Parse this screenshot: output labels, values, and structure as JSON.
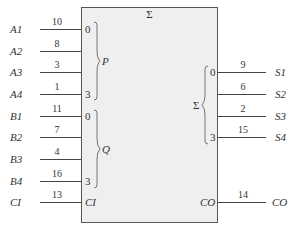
{
  "block": {
    "title": "Σ",
    "fill": "#efefef",
    "border": "#555555"
  },
  "inputs": [
    {
      "signal": "A1",
      "pin": "10",
      "port": "0",
      "y": 29
    },
    {
      "signal": "A2",
      "pin": "8",
      "port": "",
      "y": 51
    },
    {
      "signal": "A3",
      "pin": "3",
      "port": "",
      "y": 72
    },
    {
      "signal": "A4",
      "pin": "1",
      "port": "3",
      "y": 94
    },
    {
      "signal": "B1",
      "pin": "11",
      "port": "0",
      "y": 116
    },
    {
      "signal": "B2",
      "pin": "7",
      "port": "",
      "y": 137
    },
    {
      "signal": "B3",
      "pin": "4",
      "port": "",
      "y": 159
    },
    {
      "signal": "B4",
      "pin": "16",
      "port": "3",
      "y": 181
    },
    {
      "signal": "CI",
      "pin": "13",
      "port": "CI",
      "y": 202
    }
  ],
  "input_groups": [
    {
      "label": "P"
    },
    {
      "label": "Q"
    }
  ],
  "output_group": {
    "label": "Σ"
  },
  "outputs": [
    {
      "signal": "S1",
      "pin": "9",
      "port": "0",
      "y": 72
    },
    {
      "signal": "S2",
      "pin": "6",
      "port": "",
      "y": 94
    },
    {
      "signal": "S3",
      "pin": "2",
      "port": "",
      "y": 116
    },
    {
      "signal": "S4",
      "pin": "15",
      "port": "3",
      "y": 137
    },
    {
      "signal": "CO",
      "pin": "14",
      "port": "CO",
      "y": 202
    }
  ]
}
